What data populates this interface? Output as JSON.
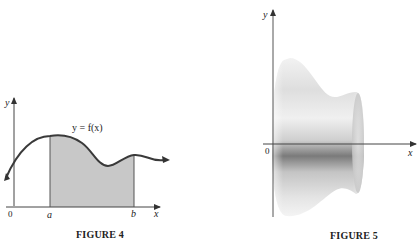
{
  "figures": [
    {
      "id": "figure-4",
      "caption": "FIGURE 4",
      "curve_label": "y = f(x)",
      "axis_labels": {
        "x": "x",
        "y": "y",
        "origin": "0"
      },
      "tick_labels": [
        "a",
        "b"
      ],
      "shaded_region": "area under y = f(x) from a to b"
    },
    {
      "id": "figure-5",
      "caption": "FIGURE 5",
      "axis_labels": {
        "x": "x",
        "y": "y",
        "origin": "0"
      },
      "description": "solid of revolution obtained by rotating the region about the x-axis"
    }
  ]
}
